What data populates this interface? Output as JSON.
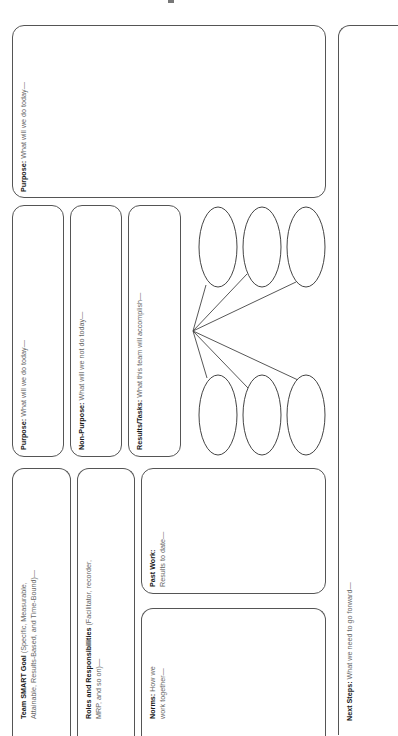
{
  "document": {
    "orientation": "rotated-90-ccw",
    "colors": {
      "border": "#555555",
      "label": "#1a1a1a",
      "text": "#666666"
    }
  },
  "boxes": {
    "purpose_large": {
      "label": "Purpose:",
      "text": " What will we do today—"
    },
    "next_steps": {
      "label": "Next Steps:",
      "text": " What we need to go forward—"
    },
    "purpose": {
      "label": "Purpose:",
      "text": " What will we do today—"
    },
    "non_purpose": {
      "label": "Non-Purpose:",
      "text": " What will we not do today—"
    },
    "results_tasks": {
      "label": "Results/Tasks:",
      "text": " What this team will accomplish—"
    },
    "smart_goal": {
      "label": "Team SMART Goal",
      "text": " (Specific, Measurable, Attainable, Results-Based, and Time-Bound)—"
    },
    "roles": {
      "label": "Roles and Responsibilities",
      "text": " (Facilitator, recorder, MRP, and so on)—"
    },
    "past_work": {
      "label": "Past Work:",
      "text": " Results to date—"
    },
    "norms": {
      "label": "Norms:",
      "text": " How we work together—"
    }
  },
  "diagram": {
    "hub": {
      "x": 193,
      "y": 331
    },
    "ovals": [
      {
        "cx": 218,
        "cy": 247,
        "rx": 19,
        "ry": 40,
        "attach": [
          206,
          285
        ]
      },
      {
        "cx": 262,
        "cy": 247,
        "rx": 19,
        "ry": 40,
        "attach": [
          247,
          274
        ]
      },
      {
        "cx": 306,
        "cy": 247,
        "rx": 19,
        "ry": 40,
        "attach": [
          296,
          282
        ]
      },
      {
        "cx": 218,
        "cy": 415,
        "rx": 19,
        "ry": 40,
        "attach": [
          207,
          378
        ]
      },
      {
        "cx": 262,
        "cy": 415,
        "rx": 19,
        "ry": 40,
        "attach": [
          248,
          388
        ]
      },
      {
        "cx": 306,
        "cy": 415,
        "rx": 19,
        "ry": 40,
        "attach": [
          298,
          380
        ]
      }
    ]
  }
}
